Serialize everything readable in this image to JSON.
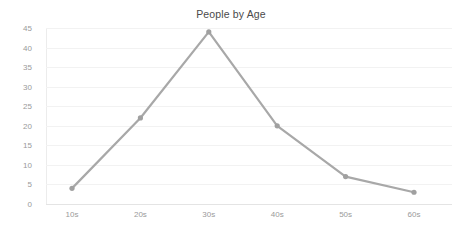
{
  "chart_data": {
    "type": "line",
    "title": "People by Age",
    "xlabel": "",
    "ylabel": "",
    "categories": [
      "10s",
      "20s",
      "30s",
      "40s",
      "50s",
      "60s"
    ],
    "values": [
      4,
      22,
      44,
      20,
      7,
      3
    ],
    "series": [
      {
        "name": "People",
        "values": [
          4,
          22,
          44,
          20,
          7,
          3
        ]
      }
    ],
    "ylim": [
      0,
      45
    ],
    "yticks": [
      0,
      5,
      10,
      15,
      20,
      25,
      30,
      35,
      40,
      45
    ],
    "ytick_labels": [
      "0",
      "5",
      "10",
      "15",
      "20",
      "25",
      "30",
      "35",
      "40",
      "45"
    ],
    "xtick_labels": [
      "10s",
      "20s",
      "30s",
      "40s",
      "50s",
      "60s"
    ],
    "grid": false,
    "legend": "none",
    "colors": {
      "line": "#a8a8a8",
      "marker": "#a0a0a0",
      "title_text": "#4a4a4a",
      "tick_text": "#9a9a9a",
      "axis": "#e4e4e4",
      "background": "#ffffff"
    }
  }
}
